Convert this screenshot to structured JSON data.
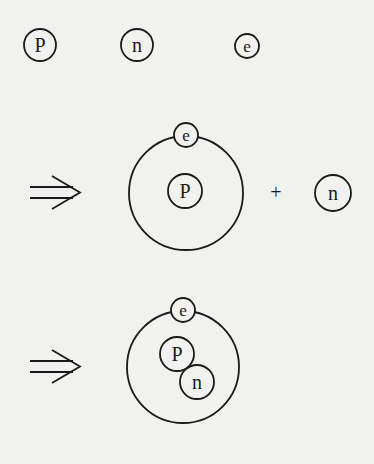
{
  "diagram": {
    "colors": {
      "background": "#f1f1ef",
      "stroke": "#1a1a1a"
    },
    "row1": {
      "particles": [
        {
          "label": "P",
          "name": "proton"
        },
        {
          "label": "n",
          "name": "neutron"
        },
        {
          "label": "e",
          "name": "electron"
        }
      ]
    },
    "row2": {
      "arrow": "implies",
      "atom": {
        "nucleus": "P",
        "electron": "e"
      },
      "operator": "+",
      "free_particle": "n"
    },
    "row3": {
      "arrow": "implies",
      "atom": {
        "nucleus": [
          "P",
          "n"
        ],
        "electron": "e"
      }
    }
  }
}
